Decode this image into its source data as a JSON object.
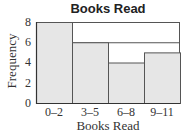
{
  "chart_data": {
    "type": "bar",
    "title": "Books Read",
    "xlabel": "Books Read",
    "ylabel": "Frequency",
    "categories": [
      "0–2",
      "3–5",
      "6–8",
      "9–11"
    ],
    "values": [
      8,
      6,
      4,
      5
    ],
    "ylim": [
      0,
      8
    ],
    "yticks": [
      "0",
      "2",
      "4",
      "6",
      "8"
    ],
    "grid": true,
    "legend": null,
    "bar_color": "#e6e6e6",
    "edge_color": "#555555"
  }
}
